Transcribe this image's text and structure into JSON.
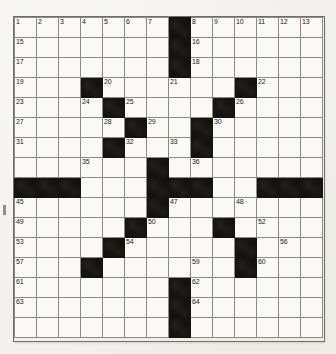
{
  "puzzle": {
    "type": "crossword-grid",
    "columns": 14,
    "rows": 16,
    "cell_size_px": 22,
    "total_numbered_clues": 64,
    "colors": {
      "paper": "#f2f1ed",
      "cell_fill": "#fbfaf7",
      "block_fill": "#15110f",
      "grid_line": "#8a8a88",
      "number_text": "#1a1a1a"
    },
    "blocks": [
      [
        1,
        8
      ],
      [
        2,
        8
      ],
      [
        3,
        8
      ],
      [
        4,
        4
      ],
      [
        4,
        11
      ],
      [
        5,
        5
      ],
      [
        5,
        10
      ],
      [
        6,
        6
      ],
      [
        6,
        9
      ],
      [
        7,
        5
      ],
      [
        7,
        9
      ],
      [
        8,
        7
      ],
      [
        9,
        1
      ],
      [
        9,
        2
      ],
      [
        9,
        3
      ],
      [
        9,
        7
      ],
      [
        9,
        8
      ],
      [
        9,
        9
      ],
      [
        9,
        12
      ],
      [
        9,
        13
      ],
      [
        9,
        14
      ],
      [
        10,
        7
      ],
      [
        11,
        6
      ],
      [
        11,
        10
      ],
      [
        12,
        5
      ],
      [
        12,
        11
      ],
      [
        13,
        4
      ],
      [
        13,
        11
      ],
      [
        14,
        8
      ],
      [
        15,
        8
      ],
      [
        16,
        8
      ]
    ],
    "numbers": [
      {
        "n": 1,
        "row": 1,
        "col": 1
      },
      {
        "n": 2,
        "row": 1,
        "col": 2
      },
      {
        "n": 3,
        "row": 1,
        "col": 3
      },
      {
        "n": 4,
        "row": 1,
        "col": 4
      },
      {
        "n": 5,
        "row": 1,
        "col": 5
      },
      {
        "n": 6,
        "row": 1,
        "col": 6
      },
      {
        "n": 7,
        "row": 1,
        "col": 7
      },
      {
        "n": 8,
        "row": 1,
        "col": 9
      },
      {
        "n": 9,
        "row": 1,
        "col": 10
      },
      {
        "n": 10,
        "row": 1,
        "col": 11
      },
      {
        "n": 11,
        "row": 1,
        "col": 12
      },
      {
        "n": 12,
        "row": 1,
        "col": 13
      },
      {
        "n": 13,
        "row": 1,
        "col": 14
      },
      {
        "n": 14,
        "row": 1,
        "col": 15
      },
      {
        "n": 15,
        "row": 2,
        "col": 1
      },
      {
        "n": 16,
        "row": 2,
        "col": 9
      },
      {
        "n": 17,
        "row": 3,
        "col": 1
      },
      {
        "n": 18,
        "row": 3,
        "col": 9
      },
      {
        "n": 19,
        "row": 4,
        "col": 1
      },
      {
        "n": 20,
        "row": 4,
        "col": 5
      },
      {
        "n": 21,
        "row": 4,
        "col": 8
      },
      {
        "n": 22,
        "row": 4,
        "col": 12
      },
      {
        "n": 23,
        "row": 5,
        "col": 1
      },
      {
        "n": 24,
        "row": 5,
        "col": 4
      },
      {
        "n": 25,
        "row": 5,
        "col": 6
      },
      {
        "n": 26,
        "row": 5,
        "col": 11
      },
      {
        "n": 27,
        "row": 6,
        "col": 1
      },
      {
        "n": 28,
        "row": 6,
        "col": 5
      },
      {
        "n": 29,
        "row": 6,
        "col": 7
      },
      {
        "n": 30,
        "row": 6,
        "col": 10
      },
      {
        "n": 31,
        "row": 7,
        "col": 1
      },
      {
        "n": 32,
        "row": 7,
        "col": 6
      },
      {
        "n": 33,
        "row": 7,
        "col": 8
      },
      {
        "n": 34,
        "row": 7,
        "col": 9
      },
      {
        "n": 35,
        "row": 8,
        "col": 4
      },
      {
        "n": 36,
        "row": 8,
        "col": 9
      },
      {
        "n": 37,
        "row": 9,
        "col": 1
      },
      {
        "n": 38,
        "row": 9,
        "col": 2
      },
      {
        "n": 39,
        "row": 9,
        "col": 3
      },
      {
        "n": 40,
        "row": 9,
        "col": 7
      },
      {
        "n": 41,
        "row": 9,
        "col": 9
      },
      {
        "n": 42,
        "row": 9,
        "col": 12
      },
      {
        "n": 43,
        "row": 9,
        "col": 13
      },
      {
        "n": 44,
        "row": 9,
        "col": 14
      },
      {
        "n": 45,
        "row": 10,
        "col": 1
      },
      {
        "n": 46,
        "row": 10,
        "col": 7
      },
      {
        "n": 47,
        "row": 10,
        "col": 8
      },
      {
        "n": 48,
        "row": 10,
        "col": 11
      },
      {
        "n": 49,
        "row": 11,
        "col": 1
      },
      {
        "n": 50,
        "row": 11,
        "col": 7
      },
      {
        "n": 51,
        "row": 11,
        "col": 10
      },
      {
        "n": 52,
        "row": 11,
        "col": 12
      },
      {
        "n": 53,
        "row": 12,
        "col": 1
      },
      {
        "n": 54,
        "row": 12,
        "col": 6
      },
      {
        "n": 55,
        "row": 12,
        "col": 11
      },
      {
        "n": 56,
        "row": 12,
        "col": 13
      },
      {
        "n": 57,
        "row": 13,
        "col": 1
      },
      {
        "n": 58,
        "row": 13,
        "col": 4
      },
      {
        "n": 59,
        "row": 13,
        "col": 9
      },
      {
        "n": 60,
        "row": 13,
        "col": 12
      },
      {
        "n": 61,
        "row": 14,
        "col": 1
      },
      {
        "n": 62,
        "row": 14,
        "col": 9
      },
      {
        "n": 63,
        "row": 15,
        "col": 1
      },
      {
        "n": 64,
        "row": 15,
        "col": 9
      }
    ]
  }
}
